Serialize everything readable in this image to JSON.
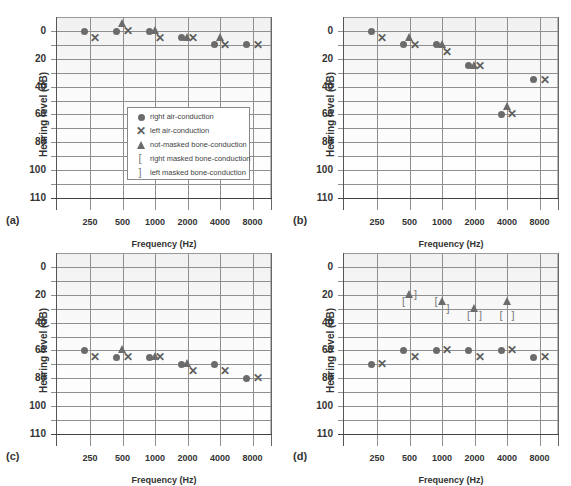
{
  "chart_data": [
    {
      "type": "scatter",
      "panel_label": "(a)",
      "title": "",
      "xlabel": "Frequency (Hz)",
      "ylabel": "Hearing level (dB)",
      "x_ticks": [
        "250",
        "500",
        "1000",
        "2000",
        "4000",
        "8000"
      ],
      "y_ticks": [
        "0",
        "20",
        "40",
        "60",
        "80",
        "100",
        "110"
      ],
      "ylim": [
        -10,
        120
      ],
      "y_inverted": true,
      "grid": true,
      "legend": {
        "position": "inside-lower-right",
        "entries": [
          {
            "symbol": "circle",
            "label": "right air-conduction"
          },
          {
            "symbol": "cross",
            "label": "left air-conduction"
          },
          {
            "symbol": "triangle",
            "label": "not-masked bone-conduction"
          },
          {
            "symbol": "open-bracket",
            "label": "right masked bone-conduction"
          },
          {
            "symbol": "close-bracket",
            "label": "left masked bone-conduction"
          }
        ]
      },
      "series": [
        {
          "name": "right air-conduction",
          "marker": "circle",
          "points": [
            {
              "x": 250,
              "y": 0
            },
            {
              "x": 500,
              "y": 0
            },
            {
              "x": 1000,
              "y": 0
            },
            {
              "x": 2000,
              "y": 5
            },
            {
              "x": 4000,
              "y": 10
            },
            {
              "x": 8000,
              "y": 10
            }
          ]
        },
        {
          "name": "left air-conduction",
          "marker": "cross",
          "points": [
            {
              "x": 250,
              "y": 5
            },
            {
              "x": 500,
              "y": 0
            },
            {
              "x": 1000,
              "y": 5
            },
            {
              "x": 2000,
              "y": 5
            },
            {
              "x": 4000,
              "y": 10
            },
            {
              "x": 8000,
              "y": 10
            }
          ]
        },
        {
          "name": "not-masked bone-conduction",
          "marker": "triangle",
          "points": [
            {
              "x": 500,
              "y": -5
            },
            {
              "x": 1000,
              "y": 0
            },
            {
              "x": 2000,
              "y": 5
            },
            {
              "x": 4000,
              "y": 5
            }
          ]
        }
      ]
    },
    {
      "type": "scatter",
      "panel_label": "(b)",
      "xlabel": "Frequency (Hz)",
      "ylabel": "Hearing level (dB)",
      "x_ticks": [
        "250",
        "500",
        "1000",
        "2000",
        "4000",
        "8000"
      ],
      "y_ticks": [
        "0",
        "20",
        "40",
        "60",
        "80",
        "100",
        "110"
      ],
      "ylim": [
        -10,
        120
      ],
      "y_inverted": true,
      "grid": true,
      "series": [
        {
          "name": "right air-conduction",
          "marker": "circle",
          "points": [
            {
              "x": 250,
              "y": 0
            },
            {
              "x": 500,
              "y": 10
            },
            {
              "x": 1000,
              "y": 10
            },
            {
              "x": 2000,
              "y": 25
            },
            {
              "x": 4000,
              "y": 60
            },
            {
              "x": 8000,
              "y": 35
            }
          ]
        },
        {
          "name": "left air-conduction",
          "marker": "cross",
          "points": [
            {
              "x": 250,
              "y": 5
            },
            {
              "x": 500,
              "y": 10
            },
            {
              "x": 1000,
              "y": 15
            },
            {
              "x": 2000,
              "y": 25
            },
            {
              "x": 4000,
              "y": 60
            },
            {
              "x": 8000,
              "y": 35
            }
          ]
        },
        {
          "name": "not-masked bone-conduction",
          "marker": "triangle",
          "points": [
            {
              "x": 500,
              "y": 5
            },
            {
              "x": 1000,
              "y": 10
            },
            {
              "x": 2000,
              "y": 25
            },
            {
              "x": 4000,
              "y": 55
            }
          ]
        }
      ]
    },
    {
      "type": "scatter",
      "panel_label": "(c)",
      "xlabel": "Frequency (Hz)",
      "ylabel": "Hearing level (dB)",
      "x_ticks": [
        "250",
        "500",
        "1000",
        "2000",
        "4000",
        "8000"
      ],
      "y_ticks": [
        "0",
        "20",
        "40",
        "60",
        "80",
        "100",
        "110"
      ],
      "ylim": [
        -10,
        120
      ],
      "y_inverted": true,
      "grid": true,
      "series": [
        {
          "name": "right air-conduction",
          "marker": "circle",
          "points": [
            {
              "x": 250,
              "y": 60
            },
            {
              "x": 500,
              "y": 65
            },
            {
              "x": 1000,
              "y": 65
            },
            {
              "x": 2000,
              "y": 70
            },
            {
              "x": 4000,
              "y": 70
            },
            {
              "x": 8000,
              "y": 80
            }
          ]
        },
        {
          "name": "left air-conduction",
          "marker": "cross",
          "points": [
            {
              "x": 250,
              "y": 65
            },
            {
              "x": 500,
              "y": 65
            },
            {
              "x": 1000,
              "y": 65
            },
            {
              "x": 2000,
              "y": 75
            },
            {
              "x": 4000,
              "y": 75
            },
            {
              "x": 8000,
              "y": 80
            }
          ]
        },
        {
          "name": "not-masked bone-conduction",
          "marker": "triangle",
          "points": [
            {
              "x": 500,
              "y": 60
            },
            {
              "x": 1000,
              "y": 65
            },
            {
              "x": 2000,
              "y": 70
            }
          ]
        }
      ]
    },
    {
      "type": "scatter",
      "panel_label": "(d)",
      "xlabel": "Frequency (Hz)",
      "ylabel": "Hearing level (dB)",
      "x_ticks": [
        "250",
        "500",
        "1000",
        "2000",
        "4000",
        "8000"
      ],
      "y_ticks": [
        "0",
        "20",
        "40",
        "60",
        "80",
        "100",
        "110"
      ],
      "ylim": [
        -10,
        120
      ],
      "y_inverted": true,
      "grid": true,
      "series": [
        {
          "name": "right air-conduction",
          "marker": "circle",
          "points": [
            {
              "x": 250,
              "y": 70
            },
            {
              "x": 500,
              "y": 60
            },
            {
              "x": 1000,
              "y": 60
            },
            {
              "x": 2000,
              "y": 60
            },
            {
              "x": 4000,
              "y": 60
            },
            {
              "x": 8000,
              "y": 65
            }
          ]
        },
        {
          "name": "left air-conduction",
          "marker": "cross",
          "points": [
            {
              "x": 250,
              "y": 70
            },
            {
              "x": 500,
              "y": 65
            },
            {
              "x": 1000,
              "y": 60
            },
            {
              "x": 2000,
              "y": 65
            },
            {
              "x": 4000,
              "y": 60
            },
            {
              "x": 8000,
              "y": 65
            }
          ]
        },
        {
          "name": "not-masked bone-conduction",
          "marker": "triangle",
          "points": [
            {
              "x": 500,
              "y": 20
            },
            {
              "x": 1000,
              "y": 25
            },
            {
              "x": 2000,
              "y": 30
            },
            {
              "x": 4000,
              "y": 25
            }
          ]
        },
        {
          "name": "right masked bone-conduction",
          "marker": "open-bracket",
          "points": [
            {
              "x": 500,
              "y": 25
            },
            {
              "x": 1000,
              "y": 25
            },
            {
              "x": 2000,
              "y": 35
            },
            {
              "x": 4000,
              "y": 35
            }
          ]
        },
        {
          "name": "left masked bone-conduction",
          "marker": "close-bracket",
          "points": [
            {
              "x": 500,
              "y": 20
            },
            {
              "x": 1000,
              "y": 30
            },
            {
              "x": 2000,
              "y": 35
            },
            {
              "x": 4000,
              "y": 35
            }
          ]
        }
      ]
    }
  ],
  "labels": {
    "xlabel": "Frequency (Hz)",
    "ylabel": "Hearing level (dB)",
    "panels": [
      "(a)",
      "(b)",
      "(c)",
      "(d)"
    ],
    "x_ticks": [
      "250",
      "500",
      "1000",
      "2000",
      "4000",
      "8000"
    ],
    "y_ticks": [
      "0",
      "20",
      "40",
      "60",
      "80",
      "100",
      "110"
    ],
    "legend": [
      "right air-conduction",
      "left air-conduction",
      "not-masked bone-conduction",
      "right masked bone-conduction",
      "left masked bone-conduction"
    ],
    "symbols": {
      "cross": "✕",
      "open_bracket": "[",
      "close_bracket": "]"
    }
  },
  "colors": {
    "marker": "#6b6b6b",
    "grid": "#8f8f8f",
    "bracket": "#7a7a7a"
  }
}
